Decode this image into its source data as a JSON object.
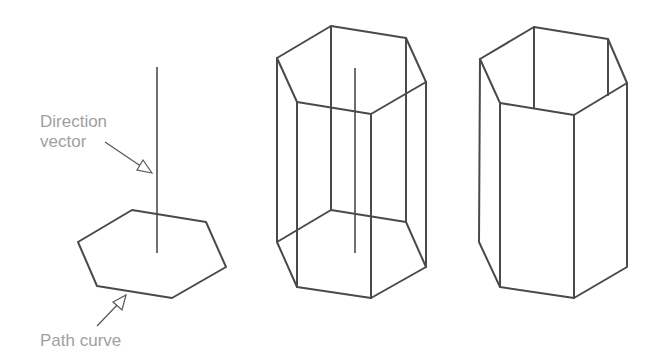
{
  "figure": {
    "panels": [
      {
        "name": "path-and-direction",
        "description": "Hexagonal path curve with vertical direction vector"
      },
      {
        "name": "wireframe-prism",
        "description": "Extruded hexagonal prism, wireframe with direction vector"
      },
      {
        "name": "solid-prism",
        "description": "Extruded hexagonal prism with hidden lines removed"
      }
    ],
    "labels": {
      "direction_line1": "Direction",
      "direction_line2": "vector",
      "path_curve": "Path curve"
    },
    "colors": {
      "line": "#4a4a4a",
      "label": "#a0a0a0",
      "background": "#ffffff"
    }
  }
}
